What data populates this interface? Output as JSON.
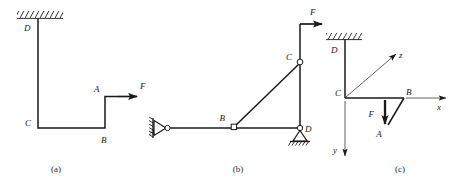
{
  "figure": {
    "type": "engineering-statics-diagram",
    "panel_count": 3,
    "line_color": "#1a1a1a",
    "background_color": "#ffffff",
    "captions": [
      "(a)",
      "(b)",
      "(c)"
    ]
  },
  "panel_a": {
    "caption": "(a)",
    "description": "Cantilever frame fixed at top with stepped member and horizontal force",
    "support": {
      "type": "fixed-hatched-ground",
      "at": "D",
      "orientation": "top"
    },
    "nodes": [
      {
        "label": "D",
        "role": "fixed-support-end"
      },
      {
        "label": "C",
        "role": "corner"
      },
      {
        "label": "B",
        "role": "corner"
      },
      {
        "label": "A",
        "role": "load-point"
      }
    ],
    "force": {
      "label": "F",
      "direction": "right",
      "applied_at": "A"
    }
  },
  "panel_b": {
    "caption": "(b)",
    "description": "Truss with pinned support at A, pin support at D, diagonal member B-C, horizontal force at top",
    "nodes": [
      {
        "label": "A",
        "role": "pin-support",
        "marker": "circle"
      },
      {
        "label": "B",
        "role": "joint",
        "marker": "square"
      },
      {
        "label": "C",
        "role": "joint",
        "marker": "circle"
      },
      {
        "label": "D",
        "role": "pin-support",
        "marker": "square"
      }
    ],
    "supports": [
      {
        "type": "pin-triangle-hatched",
        "at": "A",
        "orientation": "left"
      },
      {
        "type": "pin-triangle-hatched",
        "at": "D",
        "orientation": "bottom"
      }
    ],
    "force": {
      "label": "F",
      "direction": "right",
      "applied_at": "top-of-vertical-member"
    }
  },
  "panel_c": {
    "caption": "(c)",
    "description": "Three-dimensional frame with coordinate axes x, y, z and downward force F",
    "support": {
      "type": "fixed-hatched-ground",
      "at": "D",
      "orientation": "top"
    },
    "nodes": [
      {
        "label": "D",
        "role": "fixed-support-end"
      },
      {
        "label": "C",
        "role": "corner-origin"
      },
      {
        "label": "B",
        "role": "corner"
      },
      {
        "label": "A",
        "role": "load-point"
      }
    ],
    "axes": [
      {
        "label": "x",
        "direction": "right"
      },
      {
        "label": "y",
        "direction": "down"
      },
      {
        "label": "z",
        "direction": "up-right-diagonal"
      }
    ],
    "force": {
      "label": "F",
      "direction": "down",
      "applied_at": "A"
    }
  }
}
